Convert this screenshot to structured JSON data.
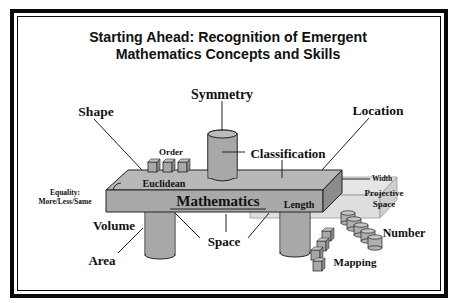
{
  "title": {
    "line1": "Starting Ahead: Recognition of Emergent",
    "line2": "Mathematics Concepts and Skills"
  },
  "diagram": {
    "center_label": "Mathematics",
    "labels": {
      "symmetry": "Symmetry",
      "shape": "Shape",
      "location": "Location",
      "order": "Order",
      "classification": "Classification",
      "euclidean": "Euclidean",
      "width": "Width",
      "equality_line1": "Equality:",
      "equality_line2": "More/Less/Same",
      "projective_line1": "Projective",
      "projective_line2": "Space",
      "length": "Length",
      "volume": "Volume",
      "number": "Number",
      "space": "Space",
      "area": "Area",
      "mapping": "Mapping"
    },
    "colors": {
      "frame": "#0a0a0a",
      "slab_top": "#b8b8b8",
      "slab_front": "#a9a9a9",
      "slab_side": "#8c8c8c",
      "ghost_slab": "#dedede",
      "cylinder": "#a8a8a8"
    }
  }
}
